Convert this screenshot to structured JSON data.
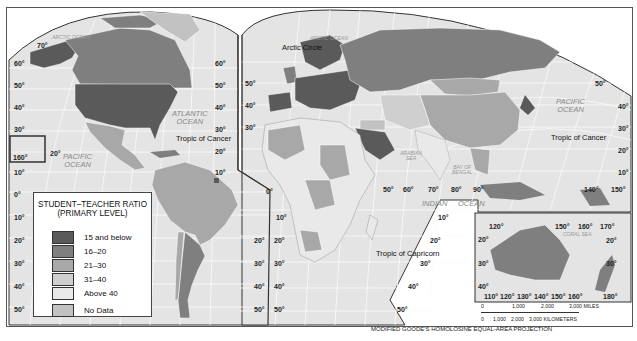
{
  "title": "Student–Teacher Ratio (Primary Level)",
  "legend": {
    "title_line1": "STUDENT–TEACHER RATIO",
    "title_line2": "(PRIMARY LEVEL)",
    "items": [
      {
        "label": "15 and below",
        "color": "#5a5a5a"
      },
      {
        "label": "16–20",
        "color": "#7f7f7f"
      },
      {
        "label": "21–30",
        "color": "#a8a8a8"
      },
      {
        "label": "31–40",
        "color": "#cfcfcf"
      },
      {
        "label": "Above 40",
        "color": "#e9e9e9"
      },
      {
        "label": "No Data",
        "color": "#c2c2c2"
      }
    ]
  },
  "oceans": {
    "arctic_west": "ARCTIC OCEAN",
    "arctic_east": "ARCTIC OCEAN",
    "atlantic_1": "ATLANTIC",
    "atlantic_2": "OCEAN",
    "pacific_west_1": "PACIFIC",
    "pacific_west_2": "OCEAN",
    "pacific_east_1": "PACIFIC",
    "pacific_east_2": "OCEAN",
    "indian_1": "INDIAN",
    "indian_2": "OCEAN",
    "arabian_1": "ARABIAN",
    "arabian_2": "SEA",
    "bengal_1": "BAY OF",
    "bengal_2": "BENGAL",
    "coral": "CORAL SEA"
  },
  "lines": {
    "arctic_circle": "Arctic Circle",
    "cancer_west": "Tropic of Cancer",
    "cancer_east": "Tropic of Cancer",
    "capricorn": "Tropic of Capricorn"
  },
  "lat_labels": {
    "west_left": [
      "70°",
      "60°",
      "50°",
      "40°",
      "30°",
      "160°",
      "10°",
      "0°",
      "10°",
      "20°",
      "30°",
      "40°",
      "50°"
    ],
    "na_right": [
      "60°",
      "50°",
      "40°",
      "30°",
      "20°",
      "10°"
    ],
    "sa_right": [
      "20°",
      "30°",
      "40°",
      "50°"
    ],
    "af_left": [
      "50°",
      "40°",
      "30°",
      "10°",
      "20°",
      "30°",
      "40°",
      "50°"
    ],
    "af_right": [
      "10°",
      "20°",
      "30°",
      "40°",
      "50°"
    ],
    "east_right": [
      "50°",
      "40°",
      "30°",
      "20°",
      "10°"
    ],
    "top_80": "80°",
    "pacific_20": "20°",
    "equator_0": "0°"
  },
  "lon_labels": {
    "indian": [
      "50°",
      "60°",
      "70°",
      "80°",
      "90°"
    ],
    "pacific": [
      "140°",
      "150°"
    ],
    "aus_top": [
      "120°",
      "150°",
      "160°",
      "170°"
    ],
    "aus_bottom": [
      "110°",
      "120°",
      "130°",
      "140°",
      "150°",
      "160°",
      "180°"
    ],
    "aus_left": [
      "20°",
      "30°",
      "40°"
    ],
    "aus_right": [
      "20°",
      "30°"
    ]
  },
  "scale": {
    "miles_ticks": [
      "0",
      "1,000",
      "2,000",
      "3,000 MILES"
    ],
    "km_ticks": [
      "0",
      "1,000",
      "2,000",
      "3,000 KILOMETERS"
    ]
  },
  "projection": "MODIFIED GOODE'S HOMOLOSINE EQUAL-AREA PROJECTION"
}
